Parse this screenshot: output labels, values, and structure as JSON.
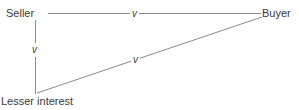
{
  "diagram": {
    "nodes": {
      "seller": {
        "label": "Seller"
      },
      "buyer": {
        "label": "Buyer"
      },
      "lesser_interest": {
        "label": "Lesser interest"
      }
    },
    "edges": [
      {
        "from": "Seller",
        "to": "Buyer",
        "label": "v"
      },
      {
        "from": "Seller",
        "to": "Lesser interest",
        "label": "v"
      },
      {
        "from": "Lesser interest",
        "to": "Buyer",
        "label": "v"
      }
    ],
    "colors": {
      "line": "#8a8a8a",
      "text": "#3a3a3a",
      "background": "#ffffff"
    }
  }
}
